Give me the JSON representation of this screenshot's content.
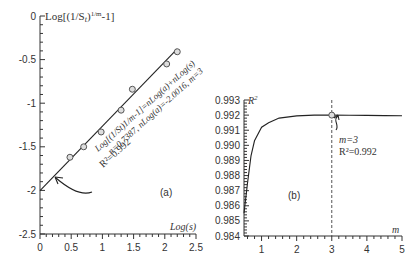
{
  "chart_data": [
    {
      "panel": "(a)",
      "type": "scatter",
      "ylabel": "Log[(1/S_t)^(1/m)-1]",
      "xlabel": "Log(s)",
      "xlim": [
        0,
        2.5
      ],
      "ylim": [
        -2.5,
        0
      ],
      "x_ticks": [
        "0",
        "0.5",
        "1",
        "1.5",
        "2",
        "2.5"
      ],
      "y_ticks": [
        "0",
        "-0.5",
        "-1",
        "-1.5",
        "-2",
        "-2.5"
      ],
      "series": [
        {
          "name": "observed",
          "x": [
            0.48,
            0.7,
            0.98,
            1.3,
            1.48,
            2.03,
            2.2
          ],
          "y": [
            -1.62,
            -1.5,
            -1.33,
            -1.08,
            -0.84,
            -0.55,
            -0.41
          ]
        },
        {
          "name": "fit",
          "x": [
            0,
            2.2
          ],
          "y": [
            -2.0016,
            -0.376
          ]
        }
      ],
      "annotation": {
        "equation": "Log[(1/S_t)^(1/m)-1]=nLog(a)+nLog(s)",
        "params": "n=0.7387, nLog(a)=-2.0016, m=3",
        "r2": "R²=0.992"
      }
    },
    {
      "panel": "(b)",
      "type": "line",
      "ylabel": "R²",
      "xlabel": "m",
      "xlim": [
        0.5,
        5
      ],
      "ylim": [
        0.984,
        0.993
      ],
      "x_ticks": [
        "1",
        "2",
        "3",
        "4",
        "5"
      ],
      "y_ticks": [
        "0.984",
        "0.985",
        "0.986",
        "0.987",
        "0.988",
        "0.989",
        "0.990",
        "0.991",
        "0.992",
        "0.993"
      ],
      "series": [
        {
          "name": "R2 vs m",
          "x": [
            0.5,
            0.6,
            0.7,
            0.8,
            1.0,
            1.2,
            1.5,
            2.0,
            2.5,
            3.0,
            3.5,
            4.0,
            4.5,
            5.0
          ],
          "y": [
            0.9855,
            0.9875,
            0.9893,
            0.9903,
            0.9912,
            0.9915,
            0.9918,
            0.99195,
            0.992,
            0.992,
            0.99199,
            0.99198,
            0.99197,
            0.99196
          ]
        }
      ],
      "marker": {
        "x": 3,
        "y": 0.992
      },
      "annotation": {
        "m": "m=3",
        "r2": "R²=0.992"
      }
    }
  ],
  "labels": {
    "a": {
      "ylabel_main": "Log[(1/S",
      "ylabel_sub": "t",
      "ylabel_mid": ")",
      "ylabel_sup": "1/m",
      "ylabel_end": "-1]",
      "xlabel": "Log(s)",
      "panel": "(a)",
      "eq1": "Log[(1/St)1/m-1]=nLog(a)+nLog(s)",
      "eq2": "n=0.7387, nLog(a)=-2.0016, m=3",
      "eq3": "R²=0.992",
      "xt": [
        "0",
        "0.5",
        "1",
        "1.5",
        "2",
        "2.5"
      ],
      "yt": [
        "0",
        "-0.5",
        "-1",
        "-1.5",
        "-2",
        "-2.5"
      ]
    },
    "b": {
      "ylabel": "R",
      "ylabel_sup": "2",
      "xlabel": "m",
      "panel": "(b)",
      "ann_m": "m=3",
      "ann_r2": "R²=0.992",
      "xt": [
        "1",
        "2",
        "3",
        "4",
        "5"
      ],
      "yt": [
        "0.984",
        "0.985",
        "0.986",
        "0.987",
        "0.988",
        "0.989",
        "0.990",
        "0.991",
        "0.992",
        "0.993"
      ]
    }
  }
}
